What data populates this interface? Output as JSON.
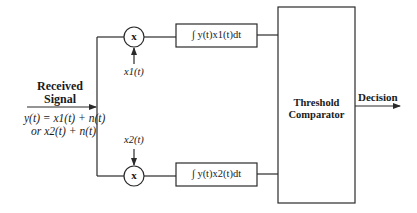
{
  "diagram": {
    "type": "block-diagram",
    "input": {
      "label_line1": "Received",
      "label_line2": "Signal",
      "eq_line1": "y(t) = x1(t) + n(t)",
      "eq_line2": "or x2(t) + n(t)"
    },
    "mixers": [
      {
        "id": "mixer-1",
        "symbol": "x",
        "reference": "x1(t)"
      },
      {
        "id": "mixer-2",
        "symbol": "x",
        "reference": "x2(t)"
      }
    ],
    "integrators": [
      {
        "id": "integrator-1",
        "label": "∫ y(t)x1(t)dt"
      },
      {
        "id": "integrator-2",
        "label": "∫ y(t)x2(t)dt"
      }
    ],
    "comparator": {
      "line1": "Threshold",
      "line2": "Comparator"
    },
    "output": {
      "label": "Decision"
    },
    "edges": [
      [
        "input",
        "split"
      ],
      [
        "split",
        "mixer-1"
      ],
      [
        "split",
        "mixer-2"
      ],
      [
        "x1(t)",
        "mixer-1"
      ],
      [
        "x2(t)",
        "mixer-2"
      ],
      [
        "mixer-1",
        "integrator-1"
      ],
      [
        "mixer-2",
        "integrator-2"
      ],
      [
        "integrator-1",
        "comparator"
      ],
      [
        "integrator-2",
        "comparator"
      ],
      [
        "comparator",
        "output"
      ]
    ],
    "colors": {
      "stroke": "#2a2a2a",
      "background": "#ffffff"
    }
  }
}
